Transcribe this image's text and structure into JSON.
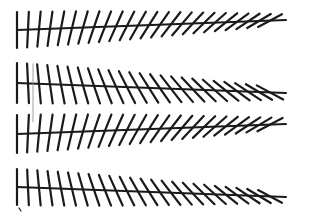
{
  "figure": {
    "background": "#ffffff",
    "stroke_color": "#1a1a1a",
    "rows": [
      {
        "id": "row-1",
        "y": 30,
        "x_start": 17,
        "x_end": 270,
        "tip_x": 286,
        "tip_y": 20,
        "tick_dir": "forward",
        "tick_count": 24,
        "tick_half_height": 18
      },
      {
        "id": "row-2",
        "y": 83,
        "x_start": 17,
        "x_end": 270,
        "tip_x": 286,
        "tip_y": 93,
        "tick_dir": "backward",
        "tick_count": 24,
        "tick_half_height": 20
      },
      {
        "id": "row-3",
        "y": 134,
        "x_start": 17,
        "x_end": 270,
        "tip_x": 286,
        "tip_y": 124,
        "tick_dir": "forward",
        "tick_count": 24,
        "tick_half_height": 19
      },
      {
        "id": "row-4",
        "y": 187,
        "x_start": 17,
        "x_end": 270,
        "tip_x": 286,
        "tip_y": 197,
        "tick_dir": "backward",
        "tick_count": 24,
        "tick_half_height": 18
      }
    ],
    "artifacts": {
      "thin_vertical_line": {
        "x": 33,
        "y1": 64,
        "y2": 122,
        "color": "#888888"
      },
      "corner_mark": {
        "x": 20,
        "y": 210
      }
    }
  }
}
